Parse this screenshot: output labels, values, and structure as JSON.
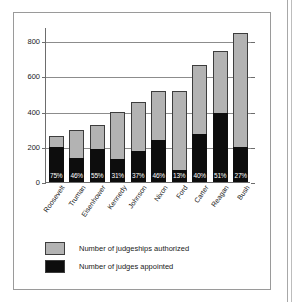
{
  "chart_data": {
    "type": "bar",
    "subtype": "stacked",
    "title": "",
    "xlabel": "",
    "ylabel": "",
    "ylim": [
      0,
      880
    ],
    "yticks": [
      0,
      200,
      400,
      600,
      800
    ],
    "ytick_labels": [
      "0",
      "200",
      "400",
      "600",
      "800"
    ],
    "grid": true,
    "legend_position": "below-axes-left",
    "categories": [
      "Roosevelt",
      "Truman",
      "Eisenhower",
      "Kennedy",
      "Johnson",
      "Nixon",
      "Ford",
      "Carter",
      "Reagan",
      "Bush"
    ],
    "series": [
      {
        "name": "Number of judgeships authorized",
        "color": "#b3b3b3",
        "values": [
          263,
          295,
          325,
          400,
          452,
          515,
          515,
          662,
          744,
          848
        ]
      },
      {
        "name": "Number of judges appointed",
        "color": "#0d0d0d",
        "values": [
          200,
          137,
          185,
          130,
          174,
          238,
          70,
          273,
          389,
          200
        ]
      }
    ],
    "point_labels": [
      "75%",
      "46%",
      "55%",
      "31%",
      "37%",
      "46%",
      "13%",
      "40%",
      "51%",
      "27%"
    ],
    "point_label_note": "percent of authorized judgeships appointed, drawn inside each black bar"
  },
  "legend": {
    "items": [
      {
        "label": "Number of judgeships authorized",
        "swatch": "authorized"
      },
      {
        "label": "Number of judges appointed",
        "swatch": "appointed"
      }
    ]
  },
  "colors": {
    "authorized": "#b3b3b3",
    "appointed": "#0d0d0d",
    "axis": "#6d6d6d",
    "grid": "#8c8c8c",
    "frame": "#9a9a9a",
    "text": "#1a1a1a"
  }
}
